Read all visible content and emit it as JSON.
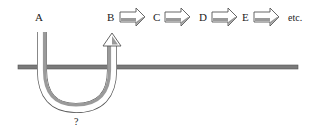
{
  "diagram": {
    "labels": {
      "start": "A",
      "chain": [
        "B",
        "C",
        "D",
        "E"
      ],
      "ellipsis": "etc.",
      "unknown": "?"
    },
    "colors": {
      "line": "#6e6e6e",
      "arrow_fill": "#ffffff",
      "arrow_shade": "#9a9a9a",
      "arrow_stroke": "#555555",
      "text": "#222222"
    }
  }
}
